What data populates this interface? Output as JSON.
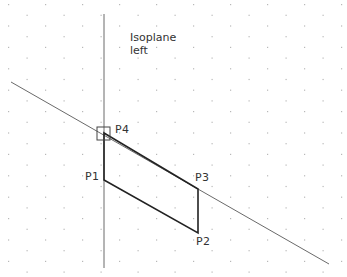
{
  "drawing": {
    "isoplane_label_line1": "Isoplane",
    "isoplane_label_line2": "left",
    "colors": {
      "background": "#ffffff",
      "grid_dot": "#b8b8b8",
      "construction_line": "#6a6a6a",
      "shape_line": "#222222",
      "text": "#333333"
    },
    "points": [
      {
        "name": "P1",
        "label": "P1",
        "x": 104,
        "y": 180
      },
      {
        "name": "P2",
        "label": "P2",
        "x": 198,
        "y": 233
      },
      {
        "name": "P3",
        "label": "P3",
        "x": 198,
        "y": 189
      },
      {
        "name": "P4",
        "label": "P4",
        "x": 104,
        "y": 133
      }
    ],
    "construction_lines": [
      {
        "name": "vertical-axis",
        "x1": 104,
        "y1": 14,
        "x2": 104,
        "y2": 268
      },
      {
        "name": "isometric-axis",
        "x1": 11,
        "y1": 82,
        "x2": 329,
        "y2": 264
      }
    ],
    "snap_box": {
      "x": 97,
      "y": 127,
      "size": 13
    }
  }
}
